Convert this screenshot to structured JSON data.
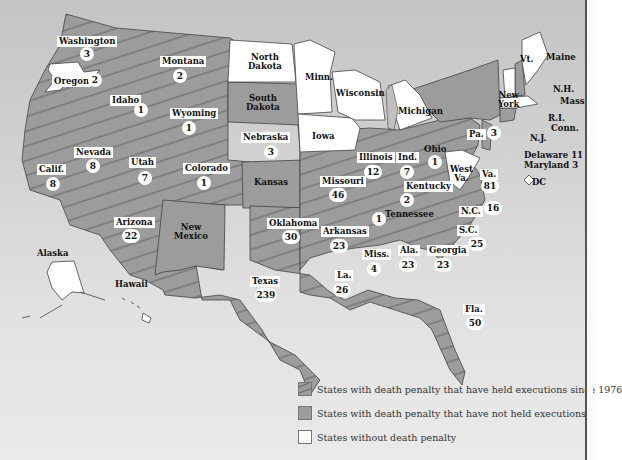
{
  "map": {
    "colors": {
      "background_top": "#c4c4c4",
      "background_bottom": "#eaeaea",
      "death_penalty_fill": "#9c9c9c",
      "no_death_penalty_fill": "#ffffff",
      "hatch": "#555555",
      "border": "#444444"
    },
    "states": [
      {
        "name": "Washington",
        "executions": "3",
        "category": "executed"
      },
      {
        "name": "Oregon",
        "executions": "2",
        "category": "executed"
      },
      {
        "name": "Montana",
        "executions": "2",
        "category": "executed"
      },
      {
        "name": "Idaho",
        "executions": "1",
        "category": "executed"
      },
      {
        "name": "Wyoming",
        "executions": "1",
        "category": "executed"
      },
      {
        "name": "Nevada",
        "executions": "8",
        "category": "executed"
      },
      {
        "name": "Calif.",
        "executions": "8",
        "category": "executed"
      },
      {
        "name": "Utah",
        "executions": "7",
        "category": "executed"
      },
      {
        "name": "Colorado",
        "executions": "1",
        "category": "executed"
      },
      {
        "name": "Nebraska",
        "executions": "3",
        "category": "executed"
      },
      {
        "name": "Arizona",
        "executions": "22",
        "category": "executed"
      },
      {
        "name": "Oklahoma",
        "executions": "30",
        "category": "executed"
      },
      {
        "name": "Texas",
        "executions": "239",
        "category": "executed"
      },
      {
        "name": "Missouri",
        "executions": "46",
        "category": "executed"
      },
      {
        "name": "Arkansas",
        "executions": "23",
        "category": "executed"
      },
      {
        "name": "La.",
        "executions": "26",
        "category": "executed"
      },
      {
        "name": "Illinois",
        "executions": "12",
        "category": "executed"
      },
      {
        "name": "Ind.",
        "executions": "7",
        "category": "executed"
      },
      {
        "name": "Ohio",
        "executions": "1",
        "category": "executed"
      },
      {
        "name": "Kentucky",
        "executions": "2",
        "category": "executed"
      },
      {
        "name": "Tennessee",
        "executions": "1",
        "category": "executed"
      },
      {
        "name": "Miss.",
        "executions": "4",
        "category": "executed"
      },
      {
        "name": "Ala.",
        "executions": "23",
        "category": "executed"
      },
      {
        "name": "Georgia",
        "executions": "23",
        "category": "executed"
      },
      {
        "name": "Fla.",
        "executions": "50",
        "category": "executed"
      },
      {
        "name": "S.C.",
        "executions": "25",
        "category": "executed"
      },
      {
        "name": "N.C.",
        "executions": "16",
        "category": "executed"
      },
      {
        "name": "Va.",
        "executions": "81",
        "category": "executed"
      },
      {
        "name": "Pa.",
        "executions": "3",
        "category": "executed"
      },
      {
        "name": "Delaware",
        "executions": "11",
        "category": "executed"
      },
      {
        "name": "Maryland",
        "executions": "3",
        "category": "executed"
      },
      {
        "name": "South Dakota",
        "executions": "",
        "category": "no_executions"
      },
      {
        "name": "Kansas",
        "executions": "",
        "category": "no_executions"
      },
      {
        "name": "New Mexico",
        "executions": "",
        "category": "no_executions"
      },
      {
        "name": "New York",
        "executions": "",
        "category": "no_executions"
      },
      {
        "name": "N.H.",
        "executions": "",
        "category": "no_executions"
      },
      {
        "name": "Conn.",
        "executions": "",
        "category": "no_executions"
      },
      {
        "name": "N.J.",
        "executions": "",
        "category": "no_executions"
      },
      {
        "name": "North Dakota",
        "executions": "",
        "category": "no_death_penalty"
      },
      {
        "name": "Minn.",
        "executions": "",
        "category": "no_death_penalty"
      },
      {
        "name": "Wisconsin",
        "executions": "",
        "category": "no_death_penalty"
      },
      {
        "name": "Michigan",
        "executions": "",
        "category": "no_death_penalty"
      },
      {
        "name": "Iowa",
        "executions": "",
        "category": "no_death_penalty"
      },
      {
        "name": "West Va.",
        "executions": "",
        "category": "no_death_penalty"
      },
      {
        "name": "Vt.",
        "executions": "",
        "category": "no_death_penalty"
      },
      {
        "name": "Maine",
        "executions": "",
        "category": "no_death_penalty"
      },
      {
        "name": "Mass.",
        "executions": "",
        "category": "no_death_penalty"
      },
      {
        "name": "R.I.",
        "executions": "",
        "category": "no_death_penalty"
      },
      {
        "name": "Alaska",
        "executions": "",
        "category": "no_death_penalty"
      },
      {
        "name": "Hawaii",
        "executions": "",
        "category": "no_death_penalty"
      },
      {
        "name": "DC",
        "executions": "",
        "category": "no_death_penalty"
      }
    ],
    "labels": {
      "washington": "Washington",
      "washington_n": "3",
      "oregon": "Oregon",
      "oregon_n": "2",
      "montana": "Montana",
      "montana_n": "2",
      "idaho": "Idaho",
      "idaho_n": "1",
      "wyoming": "Wyoming",
      "wyoming_n": "1",
      "nevada": "Nevada",
      "nevada_n": "8",
      "calif": "Calif.",
      "calif_n": "8",
      "utah": "Utah",
      "utah_n": "7",
      "colorado": "Colorado",
      "colorado_n": "1",
      "nebraska": "Nebraska",
      "nebraska_n": "3",
      "arizona": "Arizona",
      "arizona_n": "22",
      "oklahoma": "Oklahoma",
      "oklahoma_n": "30",
      "texas": "Texas",
      "texas_n": "239",
      "missouri": "Missouri",
      "missouri_n": "46",
      "arkansas": "Arkansas",
      "arkansas_n": "23",
      "la": "La.",
      "la_n": "26",
      "illinois": "Illinois",
      "illinois_n": "12",
      "ind": "Ind.",
      "ind_n": "7",
      "ohio": "Ohio",
      "ohio_n": "1",
      "kentucky": "Kentucky",
      "kentucky_n": "2",
      "tennessee": "Tennessee",
      "tennessee_n": "1",
      "miss": "Miss.",
      "miss_n": "4",
      "ala": "Ala.",
      "ala_n": "23",
      "georgia": "Georgia",
      "georgia_n": "23",
      "fla": "Fla.",
      "fla_n": "50",
      "sc": "S.C.",
      "sc_n": "25",
      "nc": "N.C.",
      "nc_n": "16",
      "va": "Va.",
      "va_n": "81",
      "pa": "Pa.",
      "pa_n": "3",
      "delaware": "Delaware 11",
      "maryland": "Maryland 3",
      "dc": "DC",
      "north_dakota_1": "North",
      "north_dakota_2": "Dakota",
      "south_dakota_1": "South",
      "south_dakota_2": "Dakota",
      "kansas": "Kansas",
      "new_mexico_1": "New",
      "new_mexico_2": "Mexico",
      "minn": "Minn.",
      "wisconsin": "Wisconsin",
      "michigan": "Michigan",
      "iowa": "Iowa",
      "west_va_1": "West",
      "west_va_2": "Va.",
      "new_york_1": "New",
      "new_york_2": "York",
      "vt": "Vt.",
      "maine": "Maine",
      "nh": "N.H.",
      "mass": "Mass.",
      "ri": "R.I.",
      "conn": "Conn.",
      "nj": "N.J.",
      "alaska": "Alaska",
      "hawaii": "Hawaii"
    }
  },
  "legend": {
    "items": [
      {
        "label": "States with death penalty that have held executions since 1976",
        "swatch": "hatched-gray"
      },
      {
        "label": "States with death penalty that have not held executions",
        "swatch": "solid-gray"
      },
      {
        "label": "States without death penalty",
        "swatch": "white"
      }
    ]
  }
}
